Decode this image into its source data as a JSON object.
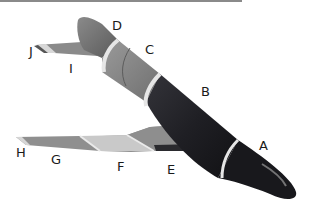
{
  "diagram": {
    "top_rule_color": "#8a8a8a",
    "colors": {
      "nose_dark": "#1b1b1f",
      "body_dark": "#202026",
      "section_c": "#8c8c8c",
      "section_d": "#7a7a7a",
      "band_light": "#e6e6e6",
      "wing_e_top": "#8e8e8e",
      "wing_e_edge": "#2a2a2e",
      "wing_f": "#c9c9c9",
      "wing_g": "#8f8f8f",
      "wing_h": "#d6d6d6",
      "tail_i": "#8a8a8a",
      "tail_j": "#d8d8d8"
    },
    "labels": [
      {
        "id": "A",
        "text": "A",
        "x": 259,
        "y": 139
      },
      {
        "id": "B",
        "text": "B",
        "x": 201,
        "y": 85
      },
      {
        "id": "C",
        "text": "C",
        "x": 145,
        "y": 43
      },
      {
        "id": "D",
        "text": "D",
        "x": 112,
        "y": 19
      },
      {
        "id": "E",
        "text": "E",
        "x": 167,
        "y": 163
      },
      {
        "id": "F",
        "text": "F",
        "x": 117,
        "y": 160
      },
      {
        "id": "G",
        "text": "G",
        "x": 51,
        "y": 153
      },
      {
        "id": "H",
        "text": "H",
        "x": 16,
        "y": 146
      },
      {
        "id": "I",
        "text": "I",
        "x": 69,
        "y": 62
      },
      {
        "id": "J",
        "text": "J",
        "x": 29,
        "y": 45
      }
    ]
  }
}
